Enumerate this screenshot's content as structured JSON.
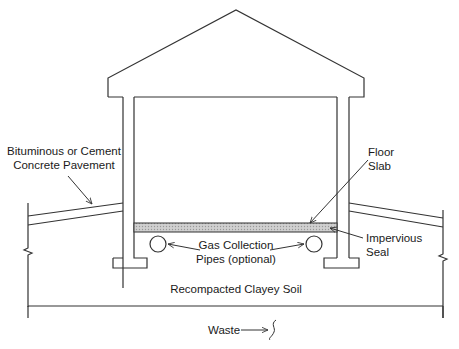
{
  "diagram": {
    "type": "cross-section",
    "labels": {
      "pavement_line1": "Bituminous or Cement",
      "pavement_line2": "Concrete Pavement",
      "floor_line1": "Floor",
      "floor_line2": "Slab",
      "seal_line1": "Impervious",
      "seal_line2": "Seal",
      "pipes_line1": "Gas Collection",
      "pipes_line2": "Pipes (optional)",
      "soil": "Recompacted Clayey Soil",
      "waste": "Waste"
    },
    "colors": {
      "line": "#333333",
      "slab_fill": "#bdbdbd",
      "background": "#ffffff"
    }
  }
}
